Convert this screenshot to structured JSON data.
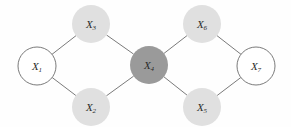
{
  "diagram": {
    "type": "undirected-graph",
    "title": "",
    "background_color": "#fefefe",
    "edge_color": "#6b6b6b",
    "label_color": "#2b2b2b",
    "node_radius": 19,
    "nodes": [
      {
        "id": "X1",
        "label_base": "X",
        "label_sub": "1",
        "cx": 37,
        "cy": 66,
        "fill": "#ffffff",
        "stroke": "#6b6b6b",
        "style": "outlined"
      },
      {
        "id": "X3",
        "label_base": "X",
        "label_sub": "3",
        "cx": 91,
        "cy": 24,
        "fill": "#e0e0e0",
        "stroke": "none",
        "style": "light-filled"
      },
      {
        "id": "X2",
        "label_base": "X",
        "label_sub": "2",
        "cx": 91,
        "cy": 107,
        "fill": "#e0e0e0",
        "stroke": "none",
        "style": "light-filled"
      },
      {
        "id": "X4",
        "label_base": "X",
        "label_sub": "4",
        "cx": 149,
        "cy": 65,
        "fill": "#9a9a9a",
        "stroke": "none",
        "style": "dark-filled"
      },
      {
        "id": "X6",
        "label_base": "X",
        "label_sub": "6",
        "cx": 202,
        "cy": 24,
        "fill": "#e0e0e0",
        "stroke": "none",
        "style": "light-filled"
      },
      {
        "id": "X5",
        "label_base": "X",
        "label_sub": "5",
        "cx": 202,
        "cy": 107,
        "fill": "#e0e0e0",
        "stroke": "none",
        "style": "light-filled"
      },
      {
        "id": "X7",
        "label_base": "X",
        "label_sub": "7",
        "cx": 256,
        "cy": 66,
        "fill": "#ffffff",
        "stroke": "#6b6b6b",
        "style": "outlined"
      }
    ],
    "edges": [
      {
        "from": "X1",
        "to": "X3"
      },
      {
        "from": "X1",
        "to": "X2"
      },
      {
        "from": "X3",
        "to": "X4"
      },
      {
        "from": "X2",
        "to": "X4"
      },
      {
        "from": "X4",
        "to": "X6"
      },
      {
        "from": "X4",
        "to": "X5"
      },
      {
        "from": "X6",
        "to": "X7"
      },
      {
        "from": "X5",
        "to": "X7"
      }
    ]
  }
}
